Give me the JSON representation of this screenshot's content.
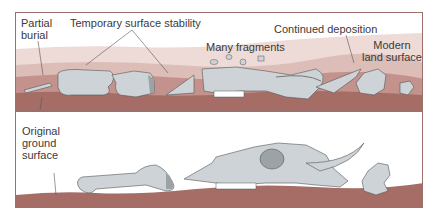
{
  "labels": {
    "partial_burial": [
      "Partial",
      "burial"
    ],
    "temporary_surface_stability": "Temporary surface stability",
    "many_fragments": "Many fragments",
    "continued_deposition": "Continued deposition",
    "modern_land_surface": [
      "Modern",
      "land surface"
    ],
    "original_ground_surface": [
      "Original",
      "ground",
      "surface"
    ]
  },
  "colors": {
    "frame": "#9c6f6c",
    "soil_dark": "#a56d66",
    "soil_mid": "#c4928c",
    "soil_light": "#ddbdb8",
    "soil_pale": "#eedad6",
    "bone": "#cdd3d6",
    "bone_shadow": "#9ca3a6",
    "outline": "#555555",
    "text": "#3a3a3a"
  }
}
